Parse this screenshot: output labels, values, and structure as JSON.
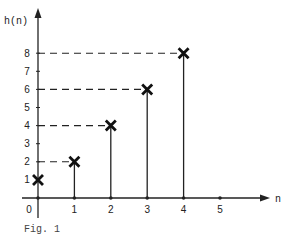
{
  "caption": "Fig. 1",
  "chart_data": {
    "type": "stem",
    "title": "",
    "xlabel": "n",
    "ylabel": "h(n)",
    "x": [
      0,
      1,
      2,
      3,
      4
    ],
    "values": [
      1,
      2,
      4,
      6,
      8
    ],
    "x_ticks": [
      0,
      1,
      2,
      3,
      4,
      5
    ],
    "y_ticks": [
      1,
      2,
      3,
      4,
      5,
      6,
      7,
      8
    ],
    "xlim": [
      0,
      6
    ],
    "ylim": [
      0,
      9
    ],
    "marker": "x",
    "dashed_guides_to_y_axis": [
      2,
      4,
      6,
      8
    ],
    "grid": false,
    "legend": null
  },
  "style": {
    "line_color": "#222222",
    "marker_color": "#111111"
  }
}
